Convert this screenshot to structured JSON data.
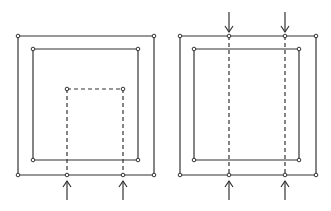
{
  "diagram": {
    "stroke_color": "#333333",
    "background": "#ffffff",
    "panels": [
      {
        "name": "left-panel",
        "outer_rect": {
          "x1": 18,
          "y1": 36,
          "x2": 154,
          "y2": 175
        },
        "inner_rect": {
          "x1": 33,
          "y1": 49,
          "x2": 138,
          "y2": 160
        },
        "dashed_rect": {
          "x1": 67,
          "y1": 89,
          "x2": 123,
          "y2": 175
        },
        "arrows_up": [
          {
            "x": 67,
            "y_tip": 181,
            "y_tail": 200
          },
          {
            "x": 123,
            "y_tip": 181,
            "y_tail": 200
          }
        ],
        "arrows_down": []
      },
      {
        "name": "right-panel",
        "outer_rect": {
          "x1": 180,
          "y1": 36,
          "x2": 316,
          "y2": 175
        },
        "inner_rect": {
          "x1": 194,
          "y1": 49,
          "x2": 299,
          "y2": 160
        },
        "dashed_lines": [
          {
            "x": 229,
            "y1": 36,
            "y2": 175
          },
          {
            "x": 285,
            "y1": 36,
            "y2": 175
          }
        ],
        "arrows_up": [
          {
            "x": 229,
            "y_tip": 181,
            "y_tail": 200
          },
          {
            "x": 285,
            "y_tip": 181,
            "y_tail": 200
          }
        ],
        "arrows_down": [
          {
            "x": 229,
            "y_tail": 12,
            "y_tip": 32
          },
          {
            "x": 285,
            "y_tail": 12,
            "y_tip": 32
          }
        ]
      }
    ]
  }
}
